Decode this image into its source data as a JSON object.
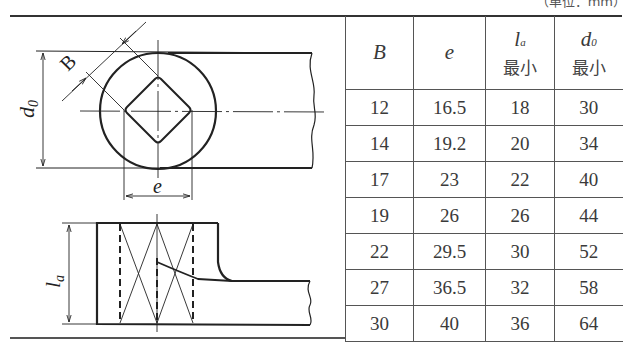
{
  "unit_note": "（单位：mm）",
  "drawing": {
    "labels": {
      "B": "B",
      "d0": "d",
      "d0_sub": "0",
      "e": "e",
      "la": "l",
      "la_sub": "a"
    }
  },
  "table": {
    "headers": [
      {
        "symbol": "B",
        "sub": "",
        "note": ""
      },
      {
        "symbol": "e",
        "sub": "",
        "note": ""
      },
      {
        "symbol": "l",
        "sub": "a",
        "note": "最小"
      },
      {
        "symbol": "d",
        "sub": "0",
        "note": "最小"
      }
    ],
    "rows": [
      {
        "B": "12",
        "e": "16.5",
        "la": "18",
        "d0": "30"
      },
      {
        "B": "14",
        "e": "19.2",
        "la": "20",
        "d0": "34"
      },
      {
        "B": "17",
        "e": "23",
        "la": "22",
        "d0": "40"
      },
      {
        "B": "19",
        "e": "26",
        "la": "26",
        "d0": "44"
      },
      {
        "B": "22",
        "e": "29.5",
        "la": "30",
        "d0": "52"
      },
      {
        "B": "27",
        "e": "36.5",
        "la": "32",
        "d0": "58"
      },
      {
        "B": "30",
        "e": "40",
        "la": "36",
        "d0": "64"
      }
    ]
  }
}
